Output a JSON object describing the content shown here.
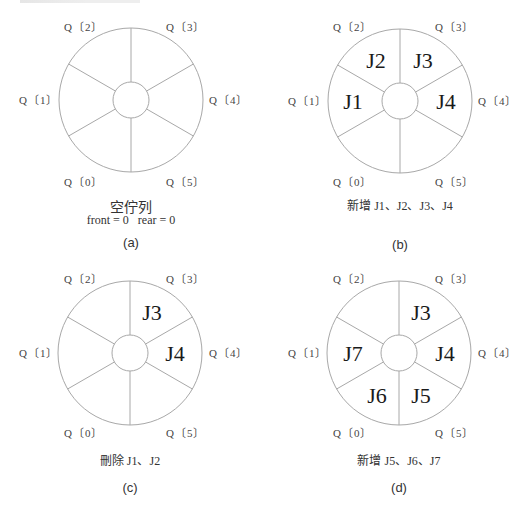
{
  "colors": {
    "stroke": "#a8a8a8",
    "text": "#222222",
    "label": "#444444"
  },
  "slot_names": [
    "Q〔0〕",
    "Q〔1〕",
    "Q〔2〕",
    "Q〔3〕",
    "Q〔4〕",
    "Q〔5〕"
  ],
  "panels": [
    {
      "id": "a",
      "tag": "(a)",
      "caption_line1": "空佇列",
      "caption_line2": "front = 0   rear = 0",
      "contents": {
        "0": "",
        "1": "",
        "2": "",
        "3": "",
        "4": "",
        "5": ""
      }
    },
    {
      "id": "b",
      "tag": "(b)",
      "caption_line1": "新增 J1、J2、J3、J4",
      "caption_line2": "",
      "contents": {
        "0": "",
        "1": "J1",
        "2": "J2",
        "3": "J3",
        "4": "J4",
        "5": ""
      }
    },
    {
      "id": "c",
      "tag": "(c)",
      "caption_line1": "刪除 J1、J2",
      "caption_line2": "",
      "contents": {
        "0": "",
        "1": "",
        "2": "",
        "3": "J3",
        "4": "J4",
        "5": ""
      }
    },
    {
      "id": "d",
      "tag": "(d)",
      "caption_line1": "新增 J5、J6、J7",
      "caption_line2": "",
      "contents": {
        "0": "J6",
        "1": "J7",
        "2": "",
        "3": "J3",
        "4": "J4",
        "5": "J5"
      }
    }
  ]
}
